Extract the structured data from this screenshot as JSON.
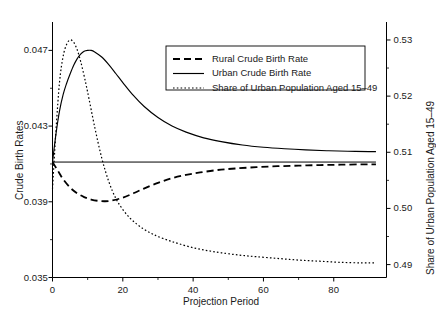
{
  "chart_data": {
    "type": "line",
    "title": "",
    "xlabel": "Projection Period",
    "ylabel": "Crude Birth Rates",
    "ylabel_right": "Share of Urban Population Aged 15–49",
    "xlim": [
      0,
      95
    ],
    "ylim": [
      0.035,
      0.0485
    ],
    "ylim_right": [
      0.4877,
      0.5332
    ],
    "grid": false,
    "legend_position": "upper center",
    "xticks": [
      0,
      20,
      40,
      60,
      80
    ],
    "xtick_labels": [
      "0",
      "20",
      "40",
      "60",
      "80"
    ],
    "yticks": [
      0.035,
      0.039,
      0.043,
      0.047
    ],
    "ytick_labels": [
      "0.035",
      "0.039",
      "0.043",
      "0.047"
    ],
    "yticks_right": [
      0.49,
      0.5,
      0.51,
      0.52,
      0.53
    ],
    "ytick_labels_right": [
      "0.49",
      "0.50",
      "0.51",
      "0.52",
      "0.53"
    ],
    "series": [
      {
        "name": "Rural Crude Birth Rate",
        "style": "dashed",
        "axis": "left",
        "x": [
          0,
          1,
          2,
          3,
          5,
          7,
          9,
          11,
          13,
          15,
          17,
          20,
          23,
          26,
          30,
          34,
          38,
          42,
          47,
          52,
          58,
          64,
          70,
          76,
          82,
          88,
          92
        ],
        "values": [
          0.0411,
          0.0408,
          0.0405,
          0.0402,
          0.03975,
          0.03945,
          0.03925,
          0.03912,
          0.03905,
          0.03903,
          0.03907,
          0.03922,
          0.03945,
          0.0397,
          0.04,
          0.04025,
          0.04042,
          0.04055,
          0.04068,
          0.04076,
          0.04083,
          0.04088,
          0.04091,
          0.04094,
          0.04096,
          0.04098,
          0.04098
        ]
      },
      {
        "name": "Urban Crude Birth Rate",
        "style": "solid",
        "axis": "left",
        "x": [
          0,
          1,
          2,
          3,
          4,
          5,
          6,
          7,
          8,
          9,
          10,
          11,
          12,
          14,
          16,
          18,
          20,
          23,
          26,
          30,
          34,
          38,
          43,
          48,
          54,
          60,
          66,
          72,
          78,
          84,
          90,
          92
        ],
        "values": [
          0.0411,
          0.0426,
          0.0438,
          0.04465,
          0.04525,
          0.04575,
          0.0462,
          0.04655,
          0.0468,
          0.04695,
          0.047,
          0.047,
          0.04692,
          0.04665,
          0.04625,
          0.04578,
          0.0453,
          0.04462,
          0.04405,
          0.04345,
          0.043,
          0.04268,
          0.04238,
          0.04218,
          0.042,
          0.04188,
          0.0418,
          0.04174,
          0.0417,
          0.04167,
          0.04165,
          0.04165
        ]
      },
      {
        "name": "Share of Urban Population Aged 15–49",
        "style": "dotted",
        "axis": "right",
        "x": [
          0,
          1,
          2,
          3,
          4,
          5,
          6,
          7,
          8,
          9,
          10,
          12,
          14,
          16,
          18,
          20,
          22,
          24,
          26,
          28,
          30,
          33,
          36,
          40,
          44,
          48,
          53,
          58,
          64,
          70,
          76,
          82,
          88,
          92
        ],
        "values": [
          0.5035,
          0.514,
          0.5225,
          0.527,
          0.5292,
          0.53,
          0.5296,
          0.5283,
          0.5262,
          0.5236,
          0.5207,
          0.5145,
          0.509,
          0.5048,
          0.5018,
          0.4998,
          0.4983,
          0.4972,
          0.4963,
          0.4956,
          0.495,
          0.4943,
          0.4937,
          0.493,
          0.4925,
          0.4921,
          0.4917,
          0.4914,
          0.4911,
          0.4908,
          0.4906,
          0.4904,
          0.4903,
          0.4903
        ]
      },
      {
        "name": "Baseline Reference",
        "style": "solid-thin",
        "axis": "left",
        "x": [
          0,
          92
        ],
        "values": [
          0.0411,
          0.0411
        ]
      }
    ]
  },
  "legend": {
    "entries": [
      {
        "label": "Rural Crude Birth Rate",
        "style": "dashed"
      },
      {
        "label": "Urban Crude Birth Rate",
        "style": "solid"
      },
      {
        "label": "Share of Urban Population Aged 15–49",
        "style": "dotted"
      }
    ]
  },
  "colors": {
    "axis": "#000000",
    "line": "#000000",
    "background": "#ffffff"
  }
}
